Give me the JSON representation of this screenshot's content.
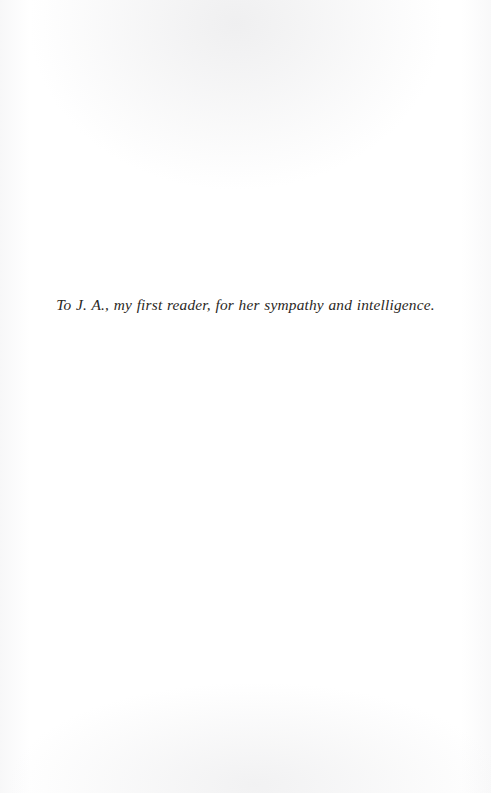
{
  "page": {
    "kind": "book-dedication-page",
    "background_color": "#ffffff",
    "ink_color": "#2b2824",
    "width_px": 491,
    "height_px": 793
  },
  "dedication": {
    "text": "To J. A., my first reader, for her sympathy and intelligence."
  }
}
